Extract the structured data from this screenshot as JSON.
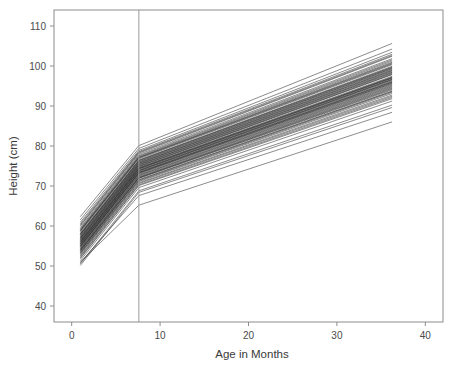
{
  "chart_data": {
    "type": "line",
    "title": "",
    "subtitle": "",
    "xlabel": "Age in Months",
    "ylabel": "Height (cm)",
    "xlim": [
      -2,
      42
    ],
    "ylim": [
      36,
      114
    ],
    "xticks": [
      0,
      10,
      20,
      30,
      40
    ],
    "xtick_labels": [
      "0",
      "10",
      "20",
      "30",
      "40"
    ],
    "yticks": [
      40,
      50,
      60,
      70,
      80,
      90,
      100,
      110
    ],
    "ytick_labels": [
      "40",
      "50",
      "60",
      "70",
      "80",
      "90",
      "100",
      "110"
    ],
    "grid": false,
    "legend": null,
    "legend_position": "none",
    "line_color": "#1a1a1a",
    "panel_border_color": "#8c8c8c",
    "background_color": "#ffffff",
    "annotations": [
      {
        "name": "knot-vertical-line",
        "type": "vline",
        "x": 7.6,
        "label": "",
        "color": "#9a9a9a"
      }
    ],
    "knot_x": 7.6,
    "x_breaks": [
      1.0,
      7.6,
      36.2
    ],
    "n_series": 62,
    "series": [
      {
        "name": "child-01",
        "x": [
          1.0,
          7.6,
          36.2
        ],
        "values": [
          56.2,
          74.6,
          97.4
        ]
      },
      {
        "name": "child-02",
        "x": [
          1.0,
          7.6,
          36.2
        ],
        "values": [
          54.8,
          73.1,
          95.6
        ]
      },
      {
        "name": "child-03",
        "x": [
          1.0,
          7.6,
          36.2
        ],
        "values": [
          58.0,
          76.3,
          99.6
        ]
      },
      {
        "name": "child-04",
        "x": [
          1.0,
          7.6,
          36.2
        ],
        "values": [
          53.6,
          71.9,
          94.0
        ]
      },
      {
        "name": "child-05",
        "x": [
          1.0,
          7.6,
          36.2
        ],
        "values": [
          57.1,
          75.4,
          98.6
        ]
      },
      {
        "name": "child-06",
        "x": [
          1.0,
          7.6,
          36.2
        ],
        "values": [
          55.4,
          73.7,
          96.3
        ]
      },
      {
        "name": "child-07",
        "x": [
          1.0,
          7.6,
          36.2
        ],
        "values": [
          59.2,
          77.4,
          101.2
        ]
      },
      {
        "name": "child-08",
        "x": [
          1.0,
          7.6,
          36.2
        ],
        "values": [
          52.6,
          70.8,
          92.7
        ]
      },
      {
        "name": "child-09",
        "x": [
          1.0,
          7.6,
          36.2
        ],
        "values": [
          56.8,
          75.0,
          98.1
        ]
      },
      {
        "name": "child-10",
        "x": [
          1.0,
          7.6,
          36.2
        ],
        "values": [
          54.1,
          72.4,
          94.8
        ]
      },
      {
        "name": "child-11",
        "x": [
          1.0,
          7.6,
          36.2
        ],
        "values": [
          60.1,
          78.2,
          102.4
        ]
      },
      {
        "name": "child-12",
        "x": [
          1.0,
          7.6,
          36.2
        ],
        "values": [
          51.4,
          69.6,
          91.2
        ]
      },
      {
        "name": "child-13",
        "x": [
          1.0,
          7.6,
          36.2
        ],
        "values": [
          57.6,
          75.8,
          99.1
        ]
      },
      {
        "name": "child-14",
        "x": [
          1.0,
          7.6,
          36.2
        ],
        "values": [
          55.0,
          73.3,
          95.9
        ]
      },
      {
        "name": "child-15",
        "x": [
          1.0,
          7.6,
          36.2
        ],
        "values": [
          58.6,
          76.8,
          100.3
        ]
      },
      {
        "name": "child-16",
        "x": [
          1.0,
          7.6,
          36.2
        ],
        "values": [
          53.1,
          71.3,
          93.4
        ]
      },
      {
        "name": "child-17",
        "x": [
          1.0,
          7.6,
          36.2
        ],
        "values": [
          56.5,
          74.8,
          97.8
        ]
      },
      {
        "name": "child-18",
        "x": [
          1.0,
          7.6,
          36.2
        ],
        "values": [
          54.4,
          72.7,
          95.2
        ]
      },
      {
        "name": "child-19",
        "x": [
          1.0,
          7.6,
          36.2
        ],
        "values": [
          61.0,
          78.9,
          103.4
        ]
      },
      {
        "name": "child-20",
        "x": [
          1.0,
          7.6,
          36.2
        ],
        "values": [
          50.6,
          68.8,
          90.2
        ]
      },
      {
        "name": "child-21",
        "x": [
          1.0,
          7.6,
          36.2
        ],
        "values": [
          57.9,
          76.1,
          99.4
        ]
      },
      {
        "name": "child-22",
        "x": [
          1.0,
          7.6,
          36.2
        ],
        "values": [
          55.7,
          74.0,
          96.7
        ]
      },
      {
        "name": "child-23",
        "x": [
          1.0,
          7.6,
          36.2
        ],
        "values": [
          59.7,
          77.9,
          101.8
        ]
      },
      {
        "name": "child-24",
        "x": [
          1.0,
          7.6,
          36.2
        ],
        "values": [
          52.1,
          70.3,
          92.1
        ]
      },
      {
        "name": "child-25",
        "x": [
          1.0,
          7.6,
          36.2
        ],
        "values": [
          56.0,
          74.3,
          97.0
        ]
      },
      {
        "name": "child-26",
        "x": [
          1.0,
          7.6,
          36.2
        ],
        "values": [
          53.9,
          72.1,
          94.4
        ]
      },
      {
        "name": "child-27",
        "x": [
          1.0,
          7.6,
          36.2
        ],
        "values": [
          58.3,
          76.5,
          99.9
        ]
      },
      {
        "name": "child-28",
        "x": [
          1.0,
          7.6,
          36.2
        ],
        "values": [
          54.6,
          72.9,
          95.4
        ]
      },
      {
        "name": "child-29",
        "x": [
          1.0,
          7.6,
          36.2
        ],
        "values": [
          57.3,
          75.6,
          98.8
        ]
      },
      {
        "name": "child-30",
        "x": [
          1.0,
          7.6,
          36.2
        ],
        "values": [
          55.2,
          73.5,
          96.1
        ]
      },
      {
        "name": "child-31",
        "x": [
          1.0,
          7.6,
          36.2
        ],
        "values": [
          60.6,
          78.6,
          102.9
        ]
      },
      {
        "name": "child-32",
        "x": [
          1.0,
          7.6,
          36.2
        ],
        "values": [
          51.9,
          70.1,
          91.8
        ]
      },
      {
        "name": "child-33",
        "x": [
          1.0,
          7.6,
          36.2
        ],
        "values": [
          56.3,
          74.5,
          97.2
        ]
      },
      {
        "name": "child-34",
        "x": [
          1.0,
          7.6,
          36.2
        ],
        "values": [
          58.9,
          77.1,
          100.7
        ]
      },
      {
        "name": "child-35",
        "x": [
          1.0,
          7.6,
          36.2
        ],
        "values": [
          53.4,
          71.6,
          93.7
        ]
      },
      {
        "name": "child-36",
        "x": [
          1.0,
          7.6,
          36.2
        ],
        "values": [
          55.9,
          74.2,
          96.9
        ]
      },
      {
        "name": "child-37",
        "x": [
          1.0,
          7.6,
          36.2
        ],
        "values": [
          57.8,
          76.0,
          99.3
        ]
      },
      {
        "name": "child-38",
        "x": [
          1.0,
          7.6,
          36.2
        ],
        "values": [
          54.0,
          72.2,
          94.6
        ]
      },
      {
        "name": "child-39",
        "x": [
          1.0,
          7.6,
          36.2
        ],
        "values": [
          59.4,
          77.6,
          101.5
        ]
      },
      {
        "name": "child-40",
        "x": [
          1.0,
          7.6,
          36.2
        ],
        "values": [
          52.9,
          71.1,
          93.1
        ]
      },
      {
        "name": "child-41",
        "x": [
          1.0,
          7.6,
          36.2
        ],
        "values": [
          56.6,
          74.9,
          97.9
        ]
      },
      {
        "name": "child-42",
        "x": [
          1.0,
          7.6,
          36.2
        ],
        "values": [
          55.5,
          73.8,
          96.5
        ]
      },
      {
        "name": "child-43",
        "x": [
          1.0,
          7.6,
          36.2
        ],
        "values": [
          61.6,
          79.4,
          104.2
        ]
      },
      {
        "name": "child-44",
        "x": [
          1.0,
          7.6,
          36.2
        ],
        "values": [
          50.2,
          68.4,
          89.6
        ]
      },
      {
        "name": "child-45",
        "x": [
          1.0,
          7.6,
          36.2
        ],
        "values": [
          58.1,
          76.4,
          99.7
        ]
      },
      {
        "name": "child-46",
        "x": [
          1.0,
          7.6,
          36.2
        ],
        "values": [
          54.3,
          72.6,
          95.0
        ]
      },
      {
        "name": "child-47",
        "x": [
          1.0,
          7.6,
          36.2
        ],
        "values": [
          57.4,
          75.7,
          98.9
        ]
      },
      {
        "name": "child-48",
        "x": [
          1.0,
          7.6,
          36.2
        ],
        "values": [
          53.8,
          72.0,
          94.2
        ]
      },
      {
        "name": "child-49",
        "x": [
          1.0,
          7.6,
          36.2
        ],
        "values": [
          60.3,
          78.4,
          102.6
        ]
      },
      {
        "name": "child-50",
        "x": [
          1.0,
          7.6,
          36.2
        ],
        "values": [
          52.4,
          70.6,
          92.4
        ]
      },
      {
        "name": "child-51",
        "x": [
          1.0,
          7.6,
          36.2
        ],
        "values": [
          56.9,
          75.2,
          98.3
        ]
      },
      {
        "name": "child-52",
        "x": [
          1.0,
          7.6,
          36.2
        ],
        "values": [
          55.1,
          73.4,
          96.0
        ]
      },
      {
        "name": "child-53",
        "x": [
          1.0,
          7.6,
          36.2
        ],
        "values": [
          58.8,
          77.0,
          100.5
        ]
      },
      {
        "name": "child-54",
        "x": [
          1.0,
          7.6,
          36.2
        ],
        "values": [
          54.9,
          73.2,
          95.7
        ]
      },
      {
        "name": "child-55",
        "x": [
          1.0,
          7.6,
          36.2
        ],
        "values": [
          57.0,
          75.3,
          98.4
        ]
      },
      {
        "name": "child-56",
        "x": [
          1.0,
          7.6,
          36.2
        ],
        "values": [
          53.3,
          71.5,
          93.6
        ]
      },
      {
        "name": "child-57",
        "x": [
          1.0,
          7.6,
          36.2
        ],
        "values": [
          59.0,
          77.2,
          100.9
        ]
      },
      {
        "name": "child-58",
        "x": [
          1.0,
          7.6,
          36.2
        ],
        "values": [
          56.1,
          74.4,
          97.1
        ]
      },
      {
        "name": "child-59",
        "x": [
          1.0,
          7.6,
          36.2
        ],
        "values": [
          62.4,
          80.1,
          105.6
        ]
      },
      {
        "name": "child-60",
        "x": [
          1.0,
          7.6,
          36.2
        ],
        "values": [
          55.6,
          73.9,
          96.6
        ]
      },
      {
        "name": "child-61",
        "x": [
          1.0,
          7.6,
          36.2
        ],
        "values": [
          51.0,
          65.2,
          86.0
        ]
      },
      {
        "name": "child-62",
        "x": [
          1.0,
          7.6,
          36.2
        ],
        "values": [
          50.9,
          67.6,
          88.4
        ]
      }
    ]
  }
}
